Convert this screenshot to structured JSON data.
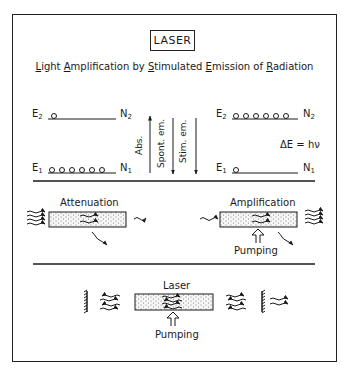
{
  "title": "LASER",
  "subtitle": {
    "words": [
      {
        "first": "L",
        "rest": "ight"
      },
      {
        "first": "A",
        "rest": "mplification"
      },
      {
        "first": "",
        "rest": "by"
      },
      {
        "first": "S",
        "rest": "timulated"
      },
      {
        "first": "E",
        "rest": "mission"
      },
      {
        "first": "",
        "rest": "of"
      },
      {
        "first": "R",
        "rest": "adiation"
      }
    ]
  },
  "energy_levels": {
    "left": {
      "upper": {
        "label": "E",
        "sub": "2",
        "pop_label": "N",
        "pop_sub": "2",
        "atoms": 1
      },
      "lower": {
        "label": "E",
        "sub": "1",
        "pop_label": "N",
        "pop_sub": "1",
        "atoms": 6
      }
    },
    "right": {
      "upper": {
        "label": "E",
        "sub": "2",
        "pop_label": "N",
        "pop_sub": "2",
        "atoms": 6
      },
      "lower": {
        "label": "E",
        "sub": "1",
        "pop_label": "N",
        "pop_sub": "1",
        "atoms": 1
      }
    },
    "transitions": [
      {
        "label": "Abs.",
        "direction": "up"
      },
      {
        "label": "Spont. em.",
        "direction": "down"
      },
      {
        "label": "Stim. em.",
        "direction": "down"
      }
    ],
    "energy_relation": "ΔE = hν"
  },
  "processes": {
    "attenuation": {
      "label": "Attenuation"
    },
    "amplification": {
      "label": "Amplification",
      "pump_label": "Pumping"
    }
  },
  "laser": {
    "label": "Laser",
    "pump_label": "Pumping"
  },
  "colors": {
    "ink": "#1a1a1a",
    "medium_fill": "#f4f4f4",
    "dots": "#555555"
  }
}
